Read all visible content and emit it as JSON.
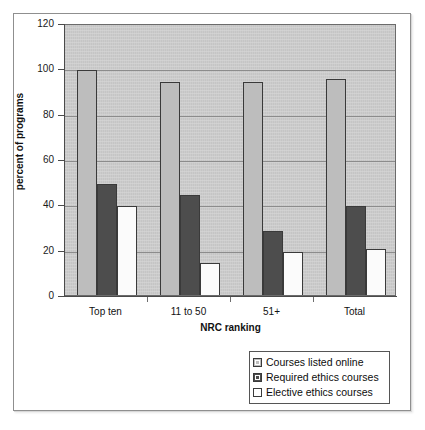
{
  "chart_data": {
    "type": "bar",
    "title": "",
    "xlabel": "NRC ranking",
    "ylabel": "percent of programs",
    "categories": [
      "Top ten",
      "11 to 50",
      "51+",
      "Total"
    ],
    "ylim": [
      0,
      120
    ],
    "yticks": [
      0,
      20,
      40,
      60,
      80,
      100,
      120
    ],
    "ytick_labels": [
      "0",
      "20",
      "40",
      "60",
      "80",
      "100",
      "120"
    ],
    "grid": true,
    "legend_position": "bottom-right",
    "series": [
      {
        "name": "Courses listed online",
        "color": "#bdbdbd",
        "values": [
          100,
          95,
          95,
          96
        ]
      },
      {
        "name": "Required ethics courses",
        "color": "#4d4d4d",
        "values": [
          50,
          45,
          29,
          40
        ]
      },
      {
        "name": "Elective ethics courses",
        "color": "#ffffff",
        "values": [
          40,
          15,
          20,
          21
        ]
      }
    ]
  },
  "legend": {
    "items": [
      {
        "label": "Courses listed online",
        "swatch": "light-gray-swatch"
      },
      {
        "label": "Required ethics courses",
        "swatch": "dark-gray-swatch"
      },
      {
        "label": "Elective ethics courses",
        "swatch": "white-swatch"
      }
    ]
  },
  "colors": {
    "plot_background": "#c9c9c9",
    "series_1": "#bdbdbd",
    "series_2": "#4d4d4d",
    "series_3": "#ffffff",
    "axis": "#4a4a4a",
    "gridline": "#8c8c8c"
  }
}
